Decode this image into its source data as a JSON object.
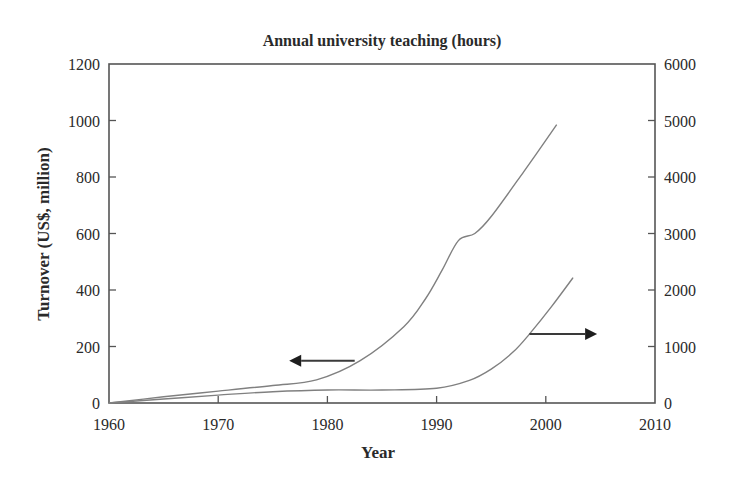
{
  "chart_data": {
    "type": "line",
    "title": "Annual university teaching (hours)",
    "xlabel": "Year",
    "ylabel": "Turnover (US$, million)",
    "y2label": "",
    "xlim": [
      1960,
      2010
    ],
    "ylim": [
      0,
      1200
    ],
    "y2lim": [
      0,
      6000
    ],
    "grid": false,
    "x_ticks": [
      1960,
      1970,
      1980,
      1990,
      2000,
      2010
    ],
    "x_tick_labels": [
      "1960",
      "1970",
      "1980",
      "1990",
      "2000",
      "2010"
    ],
    "y_ticks": [
      0,
      200,
      400,
      600,
      800,
      1000,
      1200
    ],
    "y_tick_labels": [
      "0",
      "200",
      "400",
      "600",
      "800",
      "1000",
      "1200"
    ],
    "y2_ticks": [
      0,
      1000,
      2000,
      3000,
      4000,
      5000,
      6000
    ],
    "y2_tick_labels": [
      "0",
      "1000",
      "2000",
      "3000",
      "4000",
      "5000",
      "6000"
    ],
    "series": [
      {
        "name": "Turnover (US$, million)",
        "axis": "left",
        "x": [
          1960,
          1965,
          1970,
          1975,
          1979,
          1983,
          1987,
          1989,
          1990.5,
          1992,
          1993.5,
          1995,
          1998,
          2001
        ],
        "values": [
          0,
          22,
          42,
          62,
          82,
          150,
          270,
          370,
          470,
          575,
          600,
          660,
          820,
          985
        ]
      },
      {
        "name": "Annual university teaching (hours)",
        "axis": "right",
        "x": [
          1960,
          1965,
          1970,
          1975,
          1980,
          1985,
          1990,
          1993,
          1995,
          1997,
          1998.5,
          2000.5,
          2002.5
        ],
        "values": [
          0,
          70,
          140,
          200,
          230,
          230,
          260,
          400,
          600,
          900,
          1220,
          1700,
          2220
        ]
      }
    ],
    "annotations": [
      {
        "type": "arrow",
        "direction": "left",
        "points_to_axis": "left",
        "from": [
          1982.5,
          150
        ],
        "to": [
          1976.5,
          150
        ]
      },
      {
        "type": "arrow",
        "direction": "right",
        "points_to_axis": "right",
        "from": [
          1998.5,
          1220
        ],
        "to": [
          2004.7,
          1220
        ]
      }
    ]
  }
}
